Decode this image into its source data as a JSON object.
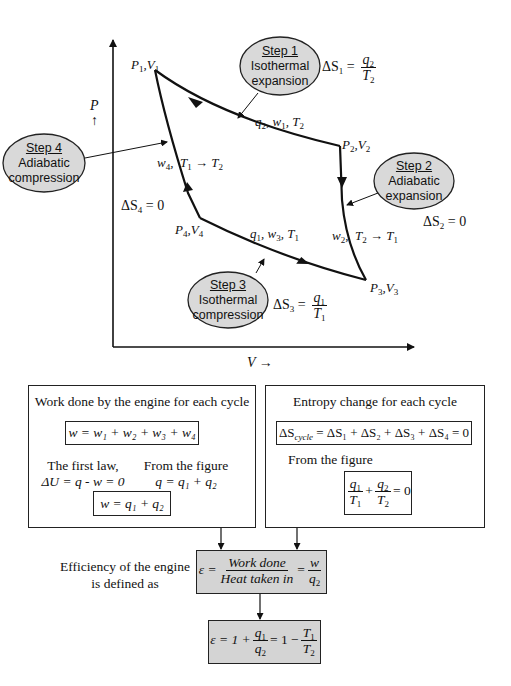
{
  "diagram": {
    "axes": {
      "y_label": "P",
      "y_arrow": "↑",
      "x_label": "V",
      "x_arrow": "→"
    },
    "points": {
      "p1": {
        "P": "P",
        "P_sub": "1",
        "V": "V",
        "V_sub": "1"
      },
      "p2": {
        "P": "P",
        "P_sub": "2",
        "V": "V",
        "V_sub": "2"
      },
      "p3": {
        "P": "P",
        "P_sub": "3",
        "V": "V",
        "V_sub": "3"
      },
      "p4": {
        "P": "P",
        "P_sub": "4",
        "V": "V",
        "V_sub": "4"
      }
    },
    "steps": [
      {
        "title": "Step 1",
        "line1": "Isothermal",
        "line2": "expansion",
        "entropy": {
          "lhs": "ΔS",
          "lhs_sub": "1",
          "eq": "=",
          "num": "q",
          "num_sub": "2",
          "den": "T",
          "den_sub": "2"
        },
        "path_label": {
          "q": "q",
          "q_sub": "2",
          "w": "w",
          "w_sub": "1",
          "T": "T",
          "T_sub": "2"
        }
      },
      {
        "title": "Step 2",
        "line1": "Adiabatic",
        "line2": "expansion",
        "entropy": {
          "lhs": "ΔS",
          "lhs_sub": "2",
          "eq": "= 0"
        },
        "path_label": {
          "w": "w",
          "w_sub": "2",
          "T_from": "T",
          "T_from_sub": "2",
          "arrow": "→",
          "T_to": "T",
          "T_to_sub": "1"
        }
      },
      {
        "title": "Step 3",
        "line1": "Isothermal",
        "line2": "compression",
        "entropy": {
          "lhs": "ΔS",
          "lhs_sub": "3",
          "eq": "=",
          "num": "q",
          "num_sub": "1",
          "den": "T",
          "den_sub": "1"
        },
        "path_label": {
          "q": "q",
          "q_sub": "1",
          "w": "w",
          "w_sub": "3",
          "T": "T",
          "T_sub": "1"
        }
      },
      {
        "title": "Step 4",
        "line1": "Adiabatic",
        "line2": "compression",
        "entropy": {
          "lhs": "ΔS",
          "lhs_sub": "4",
          "eq": "= 0"
        },
        "path_label": {
          "w": "w",
          "w_sub": "4",
          "T_from": "T",
          "T_from_sub": "1",
          "arrow": "→",
          "T_to": "T",
          "T_to_sub": "2"
        }
      }
    ],
    "colors": {
      "ellipse_fill": "#d9d9d9",
      "box_shade": "#d4d4d4",
      "line": "#111111"
    }
  },
  "work_box": {
    "heading": "Work done by the engine for each cycle",
    "eq1": {
      "lhs": "w",
      "rhs": "= w₁ + w₂ + w₃ + w₄"
    },
    "left_note": {
      "line1": "The first law,",
      "line2": "ΔU = q - w = 0"
    },
    "right_note": {
      "line1": "From the figure",
      "line2": "q = q₁ + q₂"
    },
    "eq2": {
      "lhs": "w",
      "rhs": "= q₁ + q₂"
    }
  },
  "entropy_box": {
    "heading": "Entropy change for each cycle",
    "eq1": {
      "lhs": "ΔS",
      "lhs_sub": "cycle",
      "rhs": "= ΔS₁ + ΔS₂ + ΔS₃ + ΔS₄ = 0"
    },
    "note": "From the figure",
    "eq2": {
      "n1": "q",
      "n1_sub": "1",
      "d1": "T",
      "d1_sub": "1",
      "plus": "+",
      "n2": "q",
      "n2_sub": "2",
      "d2": "T",
      "d2_sub": "2",
      "tail": "= 0"
    }
  },
  "efficiency": {
    "label_line1": "Efficiency of the engine",
    "label_line2": "is defined as",
    "eq1": {
      "lhs": "ε =",
      "num1": "Work done",
      "den1": "Heat taken in",
      "eq": "=",
      "num2": "w",
      "den2": "q",
      "den2_sub": "2"
    },
    "eq2": {
      "lhs": "ε = 1 +",
      "num1": "q",
      "num1_sub": "1",
      "den1": "q",
      "den1_sub": "2",
      "mid": "= 1 −",
      "num2": "T",
      "num2_sub": "1",
      "den2": "T",
      "den2_sub": "2"
    }
  }
}
